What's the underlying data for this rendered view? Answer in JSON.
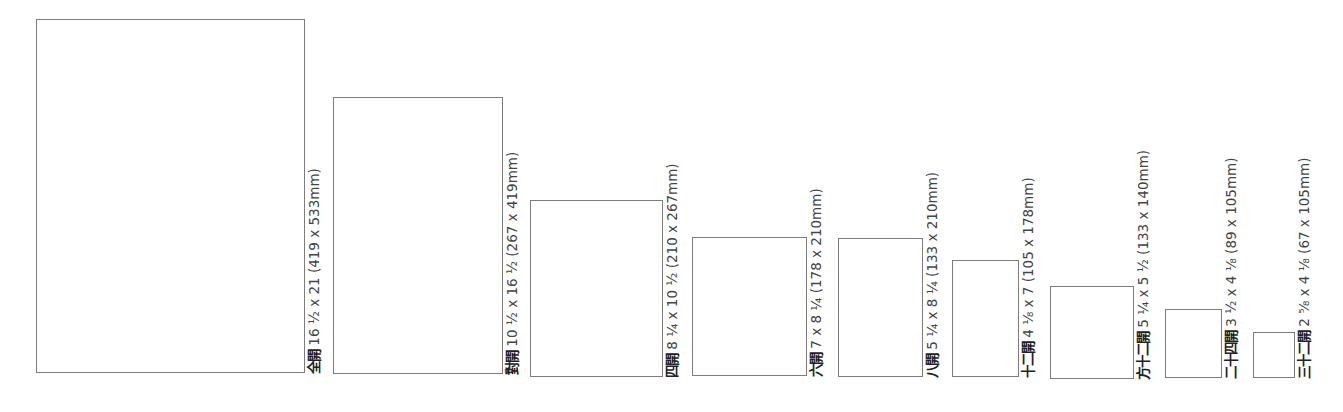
{
  "diagram": {
    "type": "paper-size-comparison",
    "stroke_color": "#7d7d7d",
    "sheets": [
      {
        "name": "全開",
        "inches": "16 ½ x 21",
        "mm": "(419 x 533mm)",
        "rect": [
          36,
          19,
          269,
          354
        ]
      },
      {
        "name": "對開",
        "inches": "10 ½ x 16 ½",
        "mm": "(267 x 419mm)",
        "rect": [
          333,
          97,
          170,
          277
        ]
      },
      {
        "name": "四開",
        "inches": "8 ¼ x 10 ½",
        "mm": "(210 x 267mm)",
        "rect": [
          530,
          200,
          133,
          177
        ]
      },
      {
        "name": "六開",
        "inches": "7 x 8 ¼",
        "mm": "(178 x 210mm)",
        "rect": [
          692,
          237,
          115,
          139
        ]
      },
      {
        "name": "八開",
        "inches": "5 ¼ x 8 ¼",
        "mm": "(133 x 210mm)",
        "rect": [
          838,
          238,
          85,
          139
        ]
      },
      {
        "name": "十二開",
        "inches": "4 ⅛ x 7",
        "mm": "(105 x 178mm)",
        "rect": [
          952,
          260,
          67,
          117
        ]
      },
      {
        "name": "方十二開",
        "inches": "5 ¼ x 5 ½",
        "mm": "(133 x 140mm)",
        "rect": [
          1050,
          286,
          84,
          93
        ]
      },
      {
        "name": "二十四開",
        "inches": "3 ½ x 4 ⅛",
        "mm": "(89 x 105mm)",
        "rect": [
          1165,
          309,
          57,
          69
        ]
      },
      {
        "name": "三十二開",
        "inches": "2 ⅝ x 4 ⅛",
        "mm": "(67 x 105mm)",
        "rect": [
          1253,
          332,
          42,
          46
        ]
      }
    ]
  }
}
